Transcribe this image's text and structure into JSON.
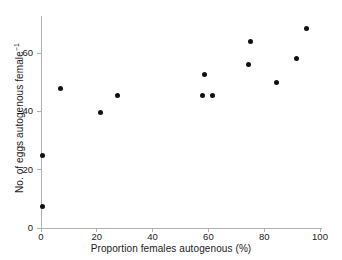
{
  "chart_data": {
    "type": "scatter",
    "title": "",
    "xlabel": "Proportion females autogenous (%)",
    "ylabel": "No. of eggs autogenous female",
    "ylabel_exponent": "−1",
    "xlim": [
      0,
      100
    ],
    "ylim": [
      0,
      72
    ],
    "xticks": [
      0,
      20,
      40,
      60,
      80,
      100
    ],
    "yticks": [
      0,
      20,
      40,
      60
    ],
    "xtick_labels": [
      "0",
      "20",
      "40",
      "60",
      "80",
      "100"
    ],
    "ytick_labels": [
      "0",
      "20",
      "40",
      "60"
    ],
    "grid": false,
    "legend": null,
    "marker": "filled-circle",
    "marker_color": "#111111",
    "axis_color": "#b0b0b0",
    "points": [
      {
        "x": 0.5,
        "y": 25.0
      },
      {
        "x": 0.5,
        "y": 7.5
      },
      {
        "x": 7.0,
        "y": 48.0
      },
      {
        "x": 21.5,
        "y": 39.5
      },
      {
        "x": 27.5,
        "y": 45.5
      },
      {
        "x": 58.0,
        "y": 45.5
      },
      {
        "x": 58.5,
        "y": 52.5
      },
      {
        "x": 61.5,
        "y": 45.5
      },
      {
        "x": 74.5,
        "y": 56.0
      },
      {
        "x": 75.0,
        "y": 64.0
      },
      {
        "x": 84.5,
        "y": 50.0
      },
      {
        "x": 91.5,
        "y": 58.0
      },
      {
        "x": 95.0,
        "y": 68.5
      }
    ]
  }
}
